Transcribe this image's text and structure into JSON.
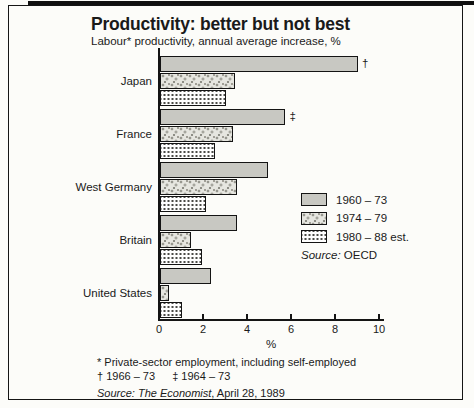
{
  "chart": {
    "title": "Productivity: better but not best",
    "subtitle": "Labour* productivity, annual average increase, %"
  },
  "chart_data": {
    "type": "bar",
    "orientation": "horizontal",
    "title": "Productivity: better but not best",
    "subtitle": "Labour* productivity, annual average increase, %",
    "categories": [
      "Japan",
      "France",
      "West Germany",
      "Britain",
      "United States"
    ],
    "series": [
      {
        "name": "1960 – 73",
        "values": [
          9.0,
          5.7,
          4.9,
          3.5,
          2.3
        ]
      },
      {
        "name": "1974 – 79",
        "values": [
          3.4,
          3.3,
          3.5,
          1.4,
          0.4
        ]
      },
      {
        "name": "1980 – 88 est.",
        "values": [
          3.0,
          2.5,
          2.1,
          1.9,
          1.0
        ]
      }
    ],
    "annotations": [
      {
        "category": "Japan",
        "series_index": 0,
        "symbol": "†"
      },
      {
        "category": "France",
        "series_index": 0,
        "symbol": "‡"
      }
    ],
    "xlabel": "%",
    "xlim": [
      0,
      10
    ],
    "xticks": [
      0,
      2,
      4,
      6,
      8,
      10
    ],
    "grid": false,
    "legend_position": "right-middle"
  },
  "legend": {
    "source_label": "Source:",
    "source_value": "OECD"
  },
  "footnotes": {
    "line1": "* Private-sector employment, including self-employed",
    "dagger_note": "† 1966 – 73",
    "ddagger_note": "‡ 1964 – 73",
    "source_label": "Source:",
    "source_publication": "The Economist",
    "source_suffix": ", April 28, 1989"
  },
  "colors": {
    "ink": "#1a1a1a",
    "bar_gray": "#c8c8c2",
    "paper": "#fcfcf9"
  }
}
